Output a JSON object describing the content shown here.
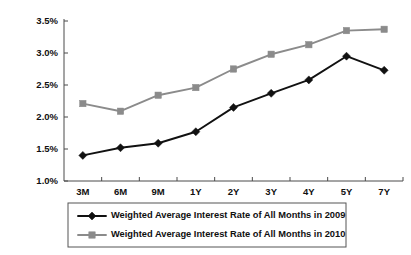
{
  "chart_data": {
    "type": "line",
    "title": "",
    "subtitle": "",
    "xlabel": "",
    "ylabel": "",
    "categories": [
      "3M",
      "6M",
      "9M",
      "1Y",
      "2Y",
      "3Y",
      "4Y",
      "5Y",
      "7Y"
    ],
    "ylim": [
      1.0,
      3.5
    ],
    "ytick_labels": [
      "3.5%",
      "3.0%",
      "2.5%",
      "2.0%",
      "1.5%",
      "1.0%"
    ],
    "ytick_values": [
      3.5,
      3.0,
      2.5,
      2.0,
      1.5,
      1.0
    ],
    "ytick_step": 0.5,
    "grid": false,
    "legend_position": "bottom",
    "value_suffix": "%",
    "series": [
      {
        "name": "Weighted Average Interest Rate of All Months in 2009",
        "color": "#111111",
        "marker": "diamond",
        "values": [
          1.4,
          1.52,
          1.59,
          1.77,
          2.15,
          2.37,
          2.58,
          2.95,
          2.73
        ]
      },
      {
        "name": "Weighted Average Interest Rate of All Months in 2010",
        "color": "#8b8b8b",
        "marker": "square",
        "values": [
          2.21,
          2.09,
          2.34,
          2.46,
          2.75,
          2.98,
          3.13,
          3.35,
          3.37
        ]
      }
    ]
  },
  "legend": {
    "items": [
      {
        "label": "Weighted Average Interest Rate of All Months in 2009"
      },
      {
        "label": "Weighted Average Interest Rate of All Months in 2010"
      }
    ]
  }
}
